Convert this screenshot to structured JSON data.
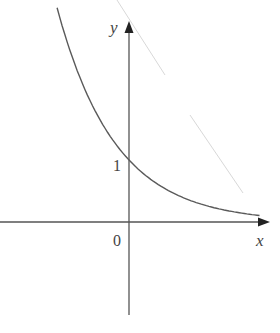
{
  "chart_data": {
    "type": "line",
    "title": "",
    "xlabel": "x",
    "ylabel": "y",
    "function": "y = e^(-x)",
    "series": [
      {
        "name": "exponential decay curve",
        "x": [
          -1.24,
          -1.0,
          -0.75,
          -0.5,
          -0.25,
          0.0,
          0.25,
          0.5,
          0.75,
          1.0,
          1.25,
          1.5,
          1.75,
          2.0,
          2.25
        ],
        "y": [
          3.1,
          2.47,
          1.98,
          1.59,
          1.27,
          1.0,
          0.8,
          0.64,
          0.51,
          0.41,
          0.33,
          0.26,
          0.21,
          0.17,
          0.14
        ]
      }
    ],
    "annotations": [
      {
        "text": "1",
        "x": 0,
        "y": 1,
        "note": "y-intercept"
      },
      {
        "text": "0",
        "x": 0,
        "y": 0,
        "note": "origin"
      }
    ],
    "guide_line": {
      "style": "faint dashed",
      "from": [
        -0.2,
        3.6
      ],
      "to": [
        1.95,
        0.48
      ]
    },
    "xlim": [
      -2.2,
      2.4
    ],
    "ylim": [
      -1.5,
      3.2
    ],
    "grid": false,
    "legend": "none"
  },
  "labels": {
    "x_axis": "x",
    "y_axis": "y",
    "origin": "0",
    "y_tick": "1"
  },
  "colors": {
    "axis": "#555555",
    "curve": "#5a5a5a",
    "guide": "#d8d8d8",
    "text": "#444444"
  }
}
